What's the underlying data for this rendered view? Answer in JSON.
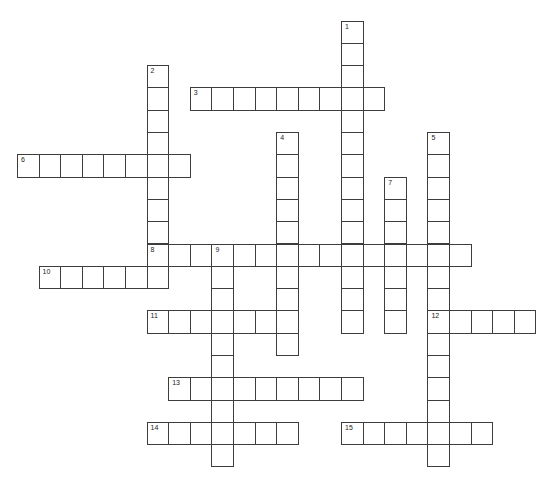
{
  "puzzle": {
    "grid": {
      "x0": 17,
      "y0": 20.5,
      "step_x": 21.6,
      "step_y": 22.3,
      "line_color": "#3d3d3d"
    },
    "entries": [
      {
        "number": "1",
        "direction": "down",
        "row": 0,
        "col": 15,
        "length": 14
      },
      {
        "number": "2",
        "direction": "down",
        "row": 2,
        "col": 6,
        "length": 10
      },
      {
        "number": "3",
        "direction": "across",
        "row": 3,
        "col": 8,
        "length": 9
      },
      {
        "number": "4",
        "direction": "down",
        "row": 5,
        "col": 12,
        "length": 10
      },
      {
        "number": "5",
        "direction": "down",
        "row": 5,
        "col": 19,
        "length": 15
      },
      {
        "number": "6",
        "direction": "across",
        "row": 6,
        "col": 0,
        "length": 8
      },
      {
        "number": "7",
        "direction": "down",
        "row": 7,
        "col": 17,
        "length": 7
      },
      {
        "number": "8",
        "direction": "across",
        "row": 10,
        "col": 6,
        "length": 15
      },
      {
        "number": "9",
        "direction": "down",
        "row": 10,
        "col": 9,
        "length": 10
      },
      {
        "number": "10",
        "direction": "across",
        "row": 11,
        "col": 1,
        "length": 6
      },
      {
        "number": "11",
        "direction": "across",
        "row": 13,
        "col": 6,
        "length": 7
      },
      {
        "number": "12",
        "direction": "across",
        "row": 13,
        "col": 19,
        "length": 5
      },
      {
        "number": "13",
        "direction": "across",
        "row": 16,
        "col": 7,
        "length": 9
      },
      {
        "number": "14",
        "direction": "across",
        "row": 18,
        "col": 6,
        "length": 7
      },
      {
        "number": "15",
        "direction": "across",
        "row": 18,
        "col": 15,
        "length": 7
      }
    ]
  }
}
